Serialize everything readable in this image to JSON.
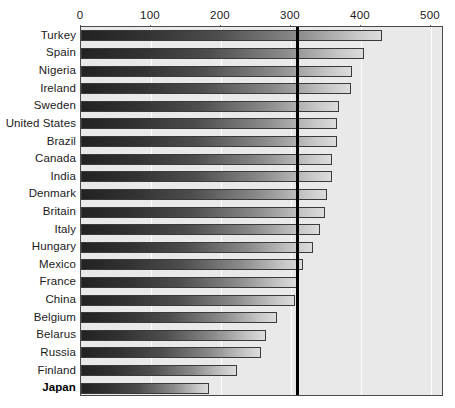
{
  "chart_data": {
    "type": "bar",
    "orientation": "horizontal",
    "title": "",
    "subtitle": "",
    "xlabel": "",
    "ylabel": "",
    "xlim": [
      0,
      518
    ],
    "grid": true,
    "gridlines_at": [
      0,
      100,
      200,
      300,
      400,
      500
    ],
    "legend": "none",
    "axis_ticks": [
      "0",
      "100",
      "200",
      "300",
      "400",
      "500"
    ],
    "axis_tick_values": [
      0,
      100,
      200,
      300,
      400,
      500
    ],
    "reference_line": {
      "value": 307,
      "label": "",
      "color": "#000000",
      "style": "solid-thick"
    },
    "categories": [
      "Turkey",
      "Spain",
      "Nigeria",
      "Ireland",
      "Sweden",
      "United States",
      "Brazil",
      "Canada",
      "India",
      "Denmark",
      "Britain",
      "Italy",
      "Hungary",
      "Mexico",
      "France",
      "China",
      "Belgium",
      "Belarus",
      "Russia",
      "Finland",
      "Japan"
    ],
    "values": [
      430,
      404,
      387,
      386,
      368,
      366,
      365,
      359,
      358,
      352,
      349,
      342,
      331,
      317,
      311,
      306,
      280,
      264,
      257,
      223,
      183
    ],
    "highlighted_categories": [
      "Japan"
    ],
    "bar_style": {
      "gradient_from": "#222222",
      "gradient_to": "#dcdcdc",
      "border": "#3a3a3a"
    },
    "plot_background": "#e9e9e9",
    "gridline_color": "#ffffff",
    "page_background": "#ffffff"
  }
}
